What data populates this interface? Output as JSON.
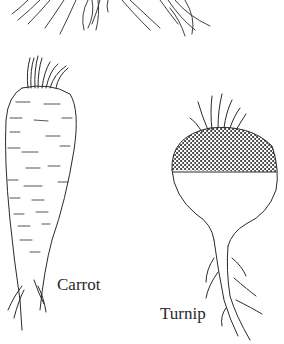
{
  "illustration": {
    "labels": {
      "carrot": "Carrot",
      "turnip": "Turnip"
    },
    "colors": {
      "background": "#ffffff",
      "ink": "#2a2a2a"
    }
  }
}
